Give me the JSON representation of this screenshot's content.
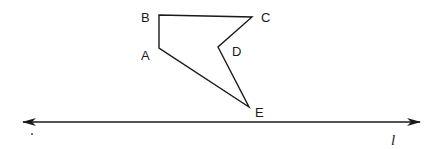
{
  "figure": {
    "type": "geometry-diagram",
    "polygon": {
      "name": "ABCDE",
      "stroke": "#1a1a1a",
      "vertices": [
        {
          "label": "A",
          "x": 159,
          "y": 48,
          "lx": 141,
          "ly": 60
        },
        {
          "label": "B",
          "x": 159,
          "y": 15,
          "lx": 141,
          "ly": 22
        },
        {
          "label": "C",
          "x": 252,
          "y": 17,
          "lx": 261,
          "ly": 22
        },
        {
          "label": "D",
          "x": 218,
          "y": 47,
          "lx": 232,
          "ly": 56
        },
        {
          "label": "E",
          "x": 249,
          "y": 107,
          "lx": 255,
          "ly": 117
        }
      ]
    },
    "line": {
      "label": "l",
      "x1": 23,
      "y1": 122,
      "x2": 420,
      "y2": 122,
      "arrows": "both",
      "label_x": 391,
      "label_y": 145
    },
    "stray_mark": {
      "x": 32,
      "y": 134
    }
  }
}
